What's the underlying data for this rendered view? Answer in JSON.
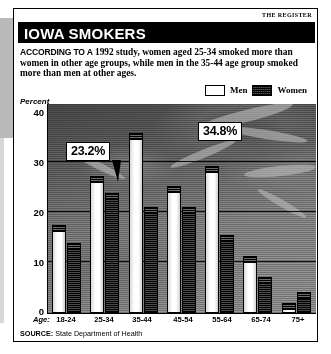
{
  "masthead": "THE REGISTER",
  "title": "IOWA SMOKERS",
  "deck": {
    "lead": "ACCORDING TO A",
    "rest": " 1992 study, women aged 25-34 smoked more than women in other age groups, while men in the 35-44 age group smoked more than men at other ages."
  },
  "legend": {
    "men_label": "Men",
    "women_label": "Women"
  },
  "axis_title": "Percent",
  "age_prefix": "Age:",
  "source": {
    "label": "SOURCE:",
    "value": " State Department of Health"
  },
  "callouts": [
    {
      "text": "23.2%"
    },
    {
      "text": "34.8%"
    }
  ],
  "colors": {
    "men_fill": "#ffffff",
    "women_fill": "#2e2e2e",
    "ink": "#000000",
    "paper": "#ffffff",
    "plot_bg": "#777777"
  },
  "chart_data": {
    "type": "bar",
    "title": "IOWA SMOKERS",
    "subtitle": "Percent of Iowans who smoke, by age group and sex, 1992",
    "xlabel": "Age:",
    "ylabel": "Percent",
    "ylim": [
      0,
      40
    ],
    "yticks": [
      0,
      10,
      20,
      30,
      40
    ],
    "grid": true,
    "legend_position": "top-right",
    "categories": [
      "18-24",
      "25-34",
      "35-44",
      "45-54",
      "55-64",
      "65-74",
      "75+"
    ],
    "series": [
      {
        "name": "Men",
        "values": [
          17.0,
          26.5,
          34.8,
          24.5,
          28.5,
          11.0,
          2.0
        ]
      },
      {
        "name": "Women",
        "values": [
          13.5,
          23.2,
          20.5,
          20.5,
          15.0,
          7.0,
          4.0
        ]
      }
    ],
    "annotations": [
      {
        "text": "23.2%",
        "series": "Women",
        "category": "25-34"
      },
      {
        "text": "34.8%",
        "series": "Men",
        "category": "35-44"
      }
    ],
    "source": "SOURCE: State Department of Health"
  }
}
